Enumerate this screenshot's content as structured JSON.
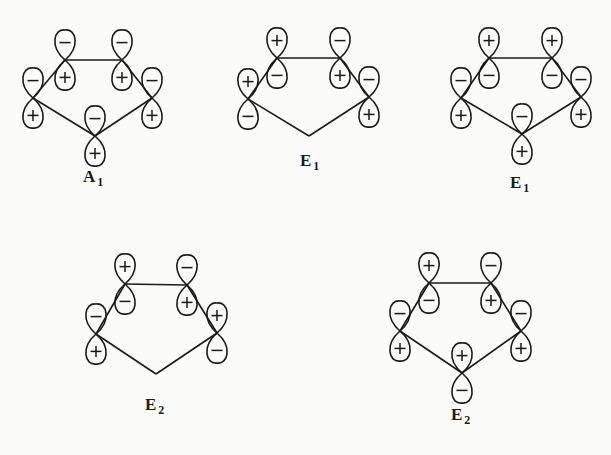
{
  "figure": {
    "diagrams": [
      {
        "id": "a1",
        "label": "A",
        "label_sub": "1",
        "atoms": [
          {
            "position": "top-left",
            "top_sign": "-",
            "bottom_sign": "+"
          },
          {
            "position": "top-right",
            "top_sign": "-",
            "bottom_sign": "+"
          },
          {
            "position": "right",
            "top_sign": "-",
            "bottom_sign": "+"
          },
          {
            "position": "bottom",
            "top_sign": "-",
            "bottom_sign": "+"
          },
          {
            "position": "left",
            "top_sign": "-",
            "bottom_sign": "+"
          }
        ]
      },
      {
        "id": "e1-a",
        "label": "E",
        "label_sub": "1",
        "atoms": [
          {
            "position": "top-left",
            "top_sign": "+",
            "bottom_sign": "-"
          },
          {
            "position": "top-right",
            "top_sign": "-",
            "bottom_sign": "+"
          },
          {
            "position": "right",
            "top_sign": "-",
            "bottom_sign": "+"
          },
          {
            "position": "bottom",
            "top_sign": null,
            "bottom_sign": null
          },
          {
            "position": "left",
            "top_sign": "+",
            "bottom_sign": "-"
          }
        ]
      },
      {
        "id": "e1-b",
        "label": "E",
        "label_sub": "1",
        "atoms": [
          {
            "position": "top-left",
            "top_sign": "+",
            "bottom_sign": "-"
          },
          {
            "position": "top-right",
            "top_sign": "+",
            "bottom_sign": "-"
          },
          {
            "position": "right",
            "top_sign": "-",
            "bottom_sign": "+"
          },
          {
            "position": "bottom",
            "top_sign": "-",
            "bottom_sign": "+"
          },
          {
            "position": "left",
            "top_sign": "-",
            "bottom_sign": "+"
          }
        ]
      },
      {
        "id": "e2-a",
        "label": "E",
        "label_sub": "2",
        "atoms": [
          {
            "position": "top-left",
            "top_sign": "+",
            "bottom_sign": "-"
          },
          {
            "position": "top-right",
            "top_sign": "-",
            "bottom_sign": "+"
          },
          {
            "position": "right",
            "top_sign": "+",
            "bottom_sign": "-"
          },
          {
            "position": "bottom",
            "top_sign": null,
            "bottom_sign": null
          },
          {
            "position": "left",
            "top_sign": "-",
            "bottom_sign": "+"
          }
        ]
      },
      {
        "id": "e2-b",
        "label": "E",
        "label_sub": "2",
        "atoms": [
          {
            "position": "top-left",
            "top_sign": "+",
            "bottom_sign": "-"
          },
          {
            "position": "top-right",
            "top_sign": "-",
            "bottom_sign": "+"
          },
          {
            "position": "right",
            "top_sign": "-",
            "bottom_sign": "+"
          },
          {
            "position": "bottom",
            "top_sign": "+",
            "bottom_sign": "-"
          },
          {
            "position": "left",
            "top_sign": "-",
            "bottom_sign": "+"
          }
        ]
      }
    ]
  }
}
